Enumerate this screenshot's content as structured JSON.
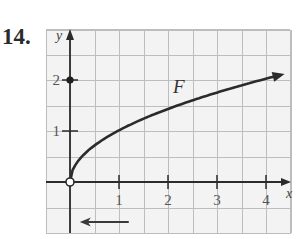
{
  "problem": {
    "number": "14."
  },
  "chart_data": {
    "type": "line",
    "title": "",
    "xlabel": "x",
    "ylabel": "y",
    "xlim": [
      -0.5,
      4.5
    ],
    "ylim": [
      -1,
      3
    ],
    "grid": true,
    "grid_step": 0.5,
    "x_ticks": [
      1,
      2,
      3,
      4
    ],
    "x_tick_labels": [
      "1",
      "2",
      "3",
      "4"
    ],
    "y_ticks": [
      1,
      2
    ],
    "y_tick_labels": [
      "1",
      "2"
    ],
    "series": [
      {
        "name": "F",
        "shape": "sqrt-like, y ≈ √x",
        "x": [
          0,
          0.25,
          0.5,
          1,
          1.5,
          2,
          2.5,
          3,
          3.5,
          4,
          4.3
        ],
        "y": [
          0,
          0.5,
          0.71,
          1.0,
          1.22,
          1.41,
          1.58,
          1.73,
          1.87,
          2.0,
          2.1
        ],
        "start_point": {
          "x": 0,
          "y": 0,
          "style": "open-circle"
        },
        "end": "arrow"
      }
    ],
    "marked_points": [
      {
        "x": 0,
        "y": 2,
        "style": "filled-dot"
      },
      {
        "x": 0,
        "y": 0,
        "style": "open-circle"
      }
    ],
    "annotations": [
      {
        "text": "F",
        "near": {
          "x": 2.1,
          "y": 1.75
        }
      },
      {
        "type": "left-arrow",
        "below_axis": true,
        "from_x": 1.2,
        "to_x": 0.2
      }
    ],
    "legend": "none"
  },
  "colors": {
    "grid": "#bdbdbd",
    "grid_bg": "#f3f3f3",
    "axis": "#2b2b2b",
    "curve": "#2b2b2b"
  }
}
